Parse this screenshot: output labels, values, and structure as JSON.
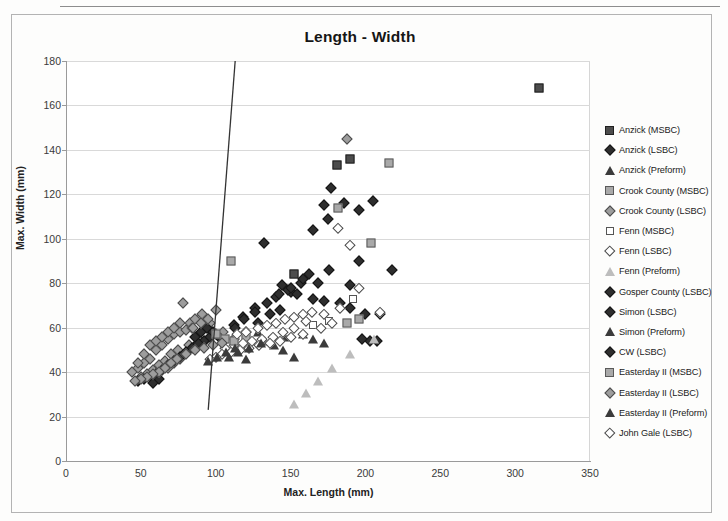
{
  "chart_data": {
    "type": "scatter",
    "title": "Length - Width",
    "xlabel": "Max. Length (mm)",
    "ylabel": "Max. Width (mm)",
    "xlim": [
      0,
      350
    ],
    "ylim": [
      0,
      180
    ],
    "xticks": [
      0,
      50,
      100,
      150,
      200,
      250,
      300,
      350
    ],
    "yticks": [
      0,
      20,
      40,
      60,
      80,
      100,
      120,
      140,
      160,
      180
    ],
    "grid": "horizontal",
    "legend_position": "right",
    "annotations": [
      {
        "type": "line",
        "name": "division-line",
        "x0": 113,
        "y0": 180,
        "x1": 95,
        "y1": 23
      }
    ],
    "series": [
      {
        "name": "Anzick (MSBC)",
        "marker": "sq-dark",
        "points": [
          [
            316,
            168
          ],
          [
            181,
            133
          ],
          [
            190,
            136
          ],
          [
            152,
            84
          ]
        ]
      },
      {
        "name": "Anzick (LSBC)",
        "marker": "di-dark",
        "points": [
          [
            177,
            123
          ],
          [
            186,
            116
          ],
          [
            175,
            109
          ],
          [
            172,
            115
          ],
          [
            196,
            113
          ],
          [
            205,
            117
          ],
          [
            196,
            90
          ],
          [
            190,
            79
          ],
          [
            176,
            86
          ],
          [
            162,
            84
          ],
          [
            168,
            80
          ],
          [
            157,
            80
          ],
          [
            150,
            76
          ],
          [
            144,
            79
          ],
          [
            154,
            75
          ],
          [
            165,
            73
          ],
          [
            172,
            72
          ],
          [
            183,
            71
          ],
          [
            190,
            69
          ],
          [
            200,
            66
          ],
          [
            210,
            66
          ],
          [
            203,
            54
          ],
          [
            198,
            55
          ],
          [
            208,
            54
          ],
          [
            218,
            86
          ],
          [
            143,
            68
          ],
          [
            136,
            66
          ],
          [
            128,
            62
          ],
          [
            120,
            58
          ],
          [
            112,
            55
          ]
        ]
      },
      {
        "name": "Anzick (Preform)",
        "marker": "tri-dark",
        "points": [
          [
            128,
            58
          ],
          [
            133,
            54
          ],
          [
            139,
            52
          ],
          [
            145,
            50
          ],
          [
            152,
            47
          ],
          [
            120,
            46
          ],
          [
            158,
            57
          ],
          [
            165,
            55
          ],
          [
            172,
            53
          ],
          [
            146,
            56
          ]
        ]
      },
      {
        "name": "Crook County (MSBC)",
        "marker": "sq-gray",
        "points": [
          [
            216,
            134
          ],
          [
            204,
            98
          ],
          [
            182,
            114
          ],
          [
            110,
            90
          ],
          [
            120,
            56
          ],
          [
            196,
            64
          ],
          [
            188,
            62
          ]
        ]
      },
      {
        "name": "Crook County (LSBC)",
        "marker": "di-gray",
        "points": [
          [
            188,
            145
          ],
          [
            78,
            71
          ],
          [
            83,
            62
          ],
          [
            90,
            65
          ],
          [
            95,
            60
          ],
          [
            100,
            57
          ],
          [
            105,
            58
          ],
          [
            88,
            55
          ],
          [
            93,
            54
          ],
          [
            82,
            52
          ],
          [
            75,
            50
          ],
          [
            70,
            48
          ],
          [
            66,
            45
          ],
          [
            62,
            43
          ],
          [
            58,
            41
          ],
          [
            54,
            39
          ],
          [
            50,
            38
          ],
          [
            60,
            50
          ],
          [
            64,
            52
          ],
          [
            68,
            55
          ],
          [
            72,
            57
          ],
          [
            76,
            58
          ],
          [
            80,
            59
          ],
          [
            84,
            60
          ],
          [
            68,
            42
          ],
          [
            72,
            44
          ],
          [
            76,
            46
          ],
          [
            56,
            46
          ],
          [
            52,
            44
          ],
          [
            48,
            42
          ],
          [
            86,
            64
          ],
          [
            91,
            66
          ],
          [
            96,
            62
          ]
        ]
      },
      {
        "name": "Fenn (MSBC)",
        "marker": "sq-open",
        "points": [
          [
            192,
            73
          ],
          [
            176,
            63
          ],
          [
            165,
            61
          ]
        ]
      },
      {
        "name": "Fenn (LSBC)",
        "marker": "di-open",
        "points": [
          [
            182,
            105
          ],
          [
            190,
            97
          ],
          [
            210,
            67
          ],
          [
            196,
            78
          ],
          [
            183,
            69
          ],
          [
            172,
            66
          ],
          [
            160,
            63
          ],
          [
            152,
            60
          ],
          [
            145,
            58
          ],
          [
            138,
            56
          ],
          [
            131,
            55
          ],
          [
            124,
            54
          ],
          [
            118,
            53
          ],
          [
            112,
            52
          ],
          [
            106,
            51
          ],
          [
            170,
            60
          ],
          [
            178,
            62
          ],
          [
            158,
            57
          ],
          [
            150,
            56
          ],
          [
            143,
            54
          ],
          [
            136,
            53
          ],
          [
            129,
            52
          ],
          [
            122,
            51
          ],
          [
            116,
            50
          ],
          [
            110,
            49
          ],
          [
            104,
            48
          ],
          [
            100,
            47
          ],
          [
            96,
            46
          ]
        ]
      },
      {
        "name": "Fenn (Preform)",
        "marker": "tri-open",
        "points": [
          [
            206,
            55
          ],
          [
            190,
            52
          ],
          [
            178,
            50
          ],
          [
            168,
            48
          ],
          [
            160,
            47
          ],
          [
            152,
            46
          ]
        ]
      },
      {
        "name": "Gosper County (LSBC)",
        "marker": "di-dark",
        "points": [
          [
            132,
            98
          ],
          [
            148,
            77
          ],
          [
            140,
            74
          ],
          [
            126,
            69
          ],
          [
            118,
            65
          ],
          [
            112,
            61
          ]
        ]
      },
      {
        "name": "Simon (LSBC)",
        "marker": "di-dark",
        "points": [
          [
            165,
            104
          ],
          [
            158,
            82
          ],
          [
            150,
            78
          ],
          [
            142,
            75
          ],
          [
            134,
            71
          ],
          [
            126,
            67
          ],
          [
            119,
            64
          ],
          [
            113,
            60
          ]
        ]
      },
      {
        "name": "Simon (Preform)",
        "marker": "tri-dark",
        "points": [
          [
            109,
            47
          ],
          [
            115,
            49
          ],
          [
            122,
            51
          ],
          [
            130,
            53
          ]
        ]
      },
      {
        "name": "CW (LSBC)",
        "marker": "di-dark",
        "points": [
          [
            96,
            56
          ],
          [
            92,
            54
          ],
          [
            88,
            53
          ],
          [
            84,
            51
          ],
          [
            80,
            49
          ],
          [
            76,
            47
          ],
          [
            72,
            45
          ],
          [
            68,
            43
          ],
          [
            64,
            41
          ],
          [
            60,
            39
          ],
          [
            56,
            38
          ],
          [
            52,
            37
          ],
          [
            48,
            36
          ],
          [
            90,
            58
          ],
          [
            86,
            56
          ],
          [
            94,
            60
          ],
          [
            98,
            58
          ],
          [
            102,
            56
          ],
          [
            58,
            35
          ],
          [
            62,
            37
          ]
        ]
      },
      {
        "name": "Easterday II (MSBC)",
        "marker": "sq-gray",
        "points": [
          [
            100,
            57
          ],
          [
            106,
            55
          ],
          [
            112,
            54
          ]
        ]
      },
      {
        "name": "Easterday II (LSBC)",
        "marker": "di-gray",
        "points": [
          [
            104,
            53
          ],
          [
            98,
            52
          ],
          [
            92,
            51
          ],
          [
            86,
            50
          ],
          [
            80,
            48
          ],
          [
            74,
            46
          ],
          [
            70,
            44
          ],
          [
            66,
            42
          ],
          [
            62,
            40
          ],
          [
            58,
            39
          ],
          [
            54,
            38
          ],
          [
            50,
            37
          ],
          [
            46,
            36
          ],
          [
            44,
            40
          ],
          [
            48,
            44
          ],
          [
            52,
            48
          ],
          [
            56,
            52
          ],
          [
            60,
            54
          ],
          [
            64,
            56
          ],
          [
            68,
            58
          ],
          [
            72,
            60
          ],
          [
            76,
            62
          ],
          [
            100,
            68
          ],
          [
            95,
            64
          ],
          [
            90,
            62
          ],
          [
            85,
            60
          ]
        ]
      },
      {
        "name": "Easterday II (Preform)",
        "marker": "tri-dark",
        "points": [
          [
            95,
            45
          ],
          [
            101,
            47
          ],
          [
            107,
            49
          ],
          [
            113,
            51
          ]
        ]
      },
      {
        "name": "John Gale (LSBC)",
        "marker": "di-open",
        "points": [
          [
            128,
            60
          ],
          [
            134,
            61
          ],
          [
            140,
            62
          ],
          [
            146,
            64
          ],
          [
            152,
            65
          ],
          [
            158,
            66
          ],
          [
            164,
            67
          ],
          [
            120,
            58
          ],
          [
            114,
            57
          ]
        ]
      }
    ]
  },
  "legend": {
    "items": [
      {
        "label": "Anzick (MSBC)",
        "marker": "sq-dark"
      },
      {
        "label": "Anzick (LSBC)",
        "marker": "di-dark"
      },
      {
        "label": "Anzick (Preform)",
        "marker": "tri-dark"
      },
      {
        "label": "Crook County (MSBC)",
        "marker": "sq-gray"
      },
      {
        "label": "Crook County (LSBC)",
        "marker": "di-gray"
      },
      {
        "label": "Fenn (MSBC)",
        "marker": "sq-open"
      },
      {
        "label": "Fenn (LSBC)",
        "marker": "di-open"
      },
      {
        "label": "Fenn (Preform)",
        "marker": "tri-open"
      },
      {
        "label": "Gosper County (LSBC)",
        "marker": "di-dark"
      },
      {
        "label": "Simon (LSBC)",
        "marker": "di-dark"
      },
      {
        "label": "Simon (Preform)",
        "marker": "tri-dark"
      },
      {
        "label": "CW (LSBC)",
        "marker": "di-dark"
      },
      {
        "label": "Easterday II (MSBC)",
        "marker": "sq-gray"
      },
      {
        "label": "Easterday II (LSBC)",
        "marker": "di-gray"
      },
      {
        "label": "Easterday II (Preform)",
        "marker": "tri-dark"
      },
      {
        "label": "John Gale (LSBC)",
        "marker": "di-open"
      }
    ]
  }
}
